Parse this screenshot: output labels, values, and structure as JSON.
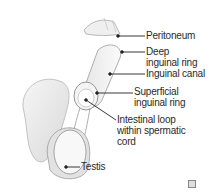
{
  "diagram": {
    "labels": {
      "peritoneum": "Peritoneum",
      "deep_ring_1": "Deep",
      "deep_ring_2": "inguinal ring",
      "inguinal_canal": "Inguinal canal",
      "superficial_ring_1": "Superficial",
      "superficial_ring_2": "inguinal ring",
      "intestinal_loop_1": "Intestinal loop",
      "intestinal_loop_2": "within spermatic",
      "intestinal_loop_3": "cord",
      "testis": "Testis"
    },
    "colors": {
      "line": "#222222",
      "text": "#2a2a2a",
      "tissue_fill": "#ededed",
      "tissue_stroke": "#9a9a9a",
      "background": "#ffffff"
    },
    "corner_icon": "image-info-icon"
  }
}
